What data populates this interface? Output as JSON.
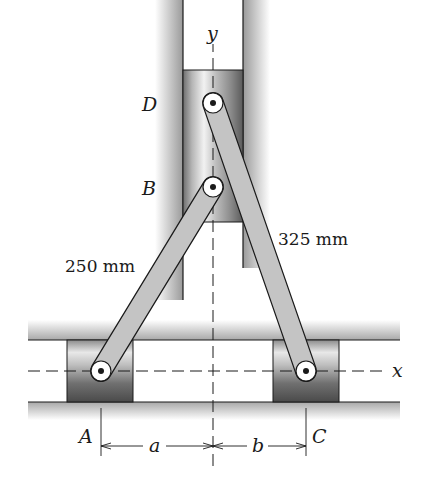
{
  "figure": {
    "type": "mechanism-diagram"
  },
  "labels": {
    "axis_x": "x",
    "axis_y": "y",
    "point_A": "A",
    "point_B": "B",
    "point_C": "C",
    "point_D": "D",
    "link_AB_length": "250 mm",
    "link_CD_length": "325 mm",
    "dim_a": "a",
    "dim_b": "b"
  },
  "colors": {
    "rail": "#b8b8b8",
    "link_fill": "#c4c4c4",
    "outline": "#1a1a1a",
    "background": "#ffffff"
  }
}
